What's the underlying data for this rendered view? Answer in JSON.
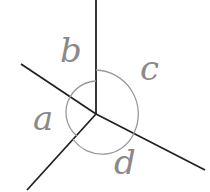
{
  "diagram": {
    "type": "angles-around-a-point",
    "labels": {
      "a": "a",
      "b": "b",
      "c": "c",
      "d": "d"
    },
    "colors": {
      "line": "#222222",
      "arc": "#9a9a9a",
      "label": "#8a8a8a"
    }
  }
}
